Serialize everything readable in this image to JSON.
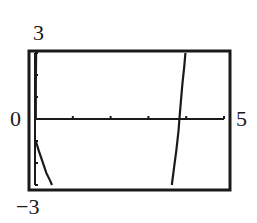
{
  "chart_data": {
    "type": "line",
    "title": "",
    "xlabel": "",
    "ylabel": "",
    "xlim": [
      0,
      5
    ],
    "ylim": [
      -3,
      3
    ],
    "x_ticks": [
      0,
      1,
      2,
      3,
      4,
      5
    ],
    "y_ticks": [
      -3,
      -2,
      -1,
      0,
      1,
      2,
      3
    ],
    "grid": false,
    "legend": null,
    "window_labels": {
      "ymax": "3",
      "ymin": "−3",
      "xmin": "0",
      "xmax": "5"
    },
    "series": [
      {
        "name": "branch-near-origin-upper",
        "x": [
          0.02,
          0.02,
          0.03
        ],
        "y": [
          0.0,
          1.5,
          3.0
        ]
      },
      {
        "name": "branch-near-origin-lower",
        "x": [
          0.02,
          0.1,
          0.2,
          0.3,
          0.4,
          0.45
        ],
        "y": [
          -1.0,
          -1.45,
          -1.95,
          -2.45,
          -2.8,
          -3.0
        ]
      },
      {
        "name": "branch-right",
        "x": [
          3.62,
          3.68,
          3.74,
          3.8,
          3.82,
          3.86,
          3.9,
          3.95,
          3.98
        ],
        "y": [
          -3.0,
          -2.2,
          -1.4,
          -0.5,
          0.0,
          0.8,
          1.6,
          2.4,
          3.0
        ]
      }
    ]
  }
}
